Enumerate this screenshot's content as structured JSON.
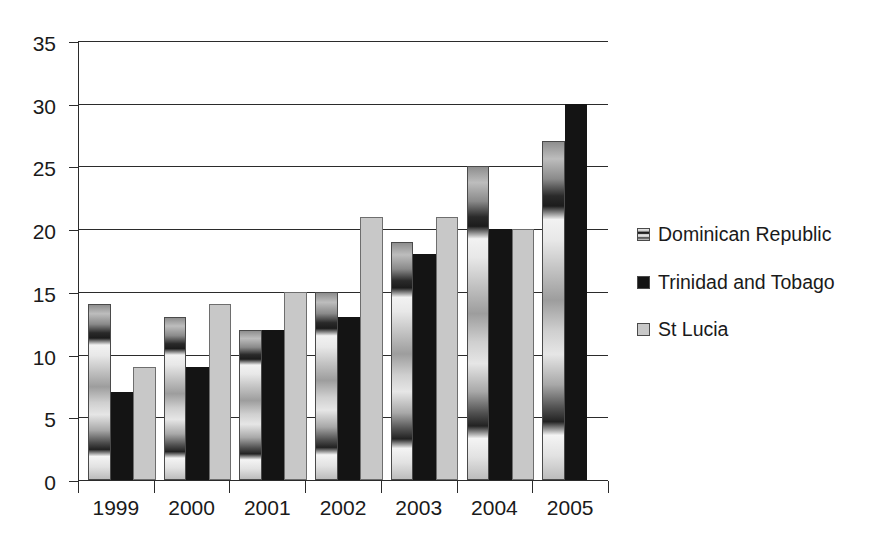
{
  "chart_data": {
    "type": "bar",
    "title": "",
    "subtitle": "",
    "xlabel": "",
    "ylabel": "",
    "categories": [
      "1999",
      "2000",
      "2001",
      "2002",
      "2003",
      "2004",
      "2005"
    ],
    "series": [
      {
        "name": "Dominican Republic",
        "color": "#9a9a9a",
        "fill": "gradient-striped",
        "values": [
          14,
          13,
          12,
          15,
          19,
          25,
          27
        ]
      },
      {
        "name": "Trinidad and Tobago",
        "color": "#141414",
        "fill": "solid-black",
        "values": [
          7,
          9,
          12,
          13,
          18,
          20,
          30
        ]
      },
      {
        "name": "St Lucia",
        "color": "#c8c8c8",
        "fill": "light-gray",
        "values": [
          9,
          14,
          15,
          21,
          21,
          20,
          null
        ]
      }
    ],
    "ylim": [
      0,
      35
    ],
    "y_ticks": [
      0,
      5,
      10,
      15,
      20,
      25,
      30,
      35
    ],
    "y_tick_labels": [
      "0",
      "5",
      "10",
      "15",
      "20",
      "25",
      "30",
      "35"
    ],
    "grid": "horizontal",
    "legend_position": "right",
    "legend_entries": [
      "Dominican Republic",
      "Trinidad and Tobago",
      "St Lucia"
    ]
  }
}
